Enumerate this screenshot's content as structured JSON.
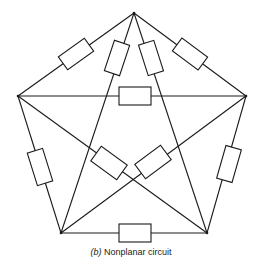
{
  "caption": {
    "label": "(b)",
    "text": "Nonplanar circuit"
  },
  "diagram": {
    "type": "circuit-graph",
    "nodes": [
      {
        "id": "top",
        "x": 134,
        "y": 13
      },
      {
        "id": "left",
        "x": 18,
        "y": 96
      },
      {
        "id": "right",
        "x": 246,
        "y": 96
      },
      {
        "id": "bottom-left",
        "x": 61,
        "y": 233
      },
      {
        "id": "bottom-right",
        "x": 207,
        "y": 233
      }
    ],
    "edges": [
      {
        "from": "top",
        "to": "left",
        "element": "resistor"
      },
      {
        "from": "top",
        "to": "right",
        "element": "resistor"
      },
      {
        "from": "top",
        "to": "bottom-left",
        "element": "resistor"
      },
      {
        "from": "top",
        "to": "bottom-right",
        "element": "resistor"
      },
      {
        "from": "left",
        "to": "right",
        "element": "resistor"
      },
      {
        "from": "left",
        "to": "bottom-left",
        "element": "resistor"
      },
      {
        "from": "right",
        "to": "bottom-right",
        "element": "resistor"
      },
      {
        "from": "left",
        "to": "bottom-right",
        "element": "resistor"
      },
      {
        "from": "right",
        "to": "bottom-left",
        "element": "resistor"
      },
      {
        "from": "bottom-left",
        "to": "bottom-right",
        "element": "resistor"
      }
    ]
  }
}
